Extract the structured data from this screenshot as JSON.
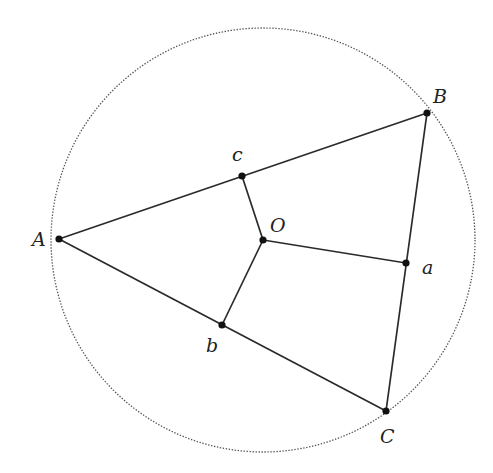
{
  "diagram": {
    "colors": {
      "line": "#2a2a2a",
      "circle": "#555555",
      "point": "#111111",
      "background": "#ffffff"
    },
    "circle": {
      "center": "O",
      "cx": 263,
      "cy": 240,
      "r": 212,
      "style": "dotted"
    },
    "points": [
      {
        "id": "A",
        "label": "A",
        "x": 59,
        "y": 239,
        "lx": 32,
        "ly": 246
      },
      {
        "id": "B",
        "label": "B",
        "x": 427,
        "y": 113,
        "lx": 433,
        "ly": 103
      },
      {
        "id": "C",
        "label": "C",
        "x": 386,
        "y": 411,
        "lx": 380,
        "ly": 443
      },
      {
        "id": "O",
        "label": "O",
        "x": 263,
        "y": 240,
        "lx": 270,
        "ly": 232
      },
      {
        "id": "a",
        "label": "a",
        "x": 406,
        "y": 263,
        "lx": 422,
        "ly": 274
      },
      {
        "id": "b",
        "label": "b",
        "x": 222,
        "y": 325,
        "lx": 206,
        "ly": 352
      },
      {
        "id": "c",
        "label": "c",
        "x": 242,
        "y": 176,
        "lx": 232,
        "ly": 161
      }
    ],
    "segments": [
      {
        "from": "A",
        "to": "B"
      },
      {
        "from": "B",
        "to": "C"
      },
      {
        "from": "C",
        "to": "A"
      },
      {
        "from": "O",
        "to": "a"
      },
      {
        "from": "O",
        "to": "b"
      },
      {
        "from": "O",
        "to": "c"
      }
    ]
  }
}
